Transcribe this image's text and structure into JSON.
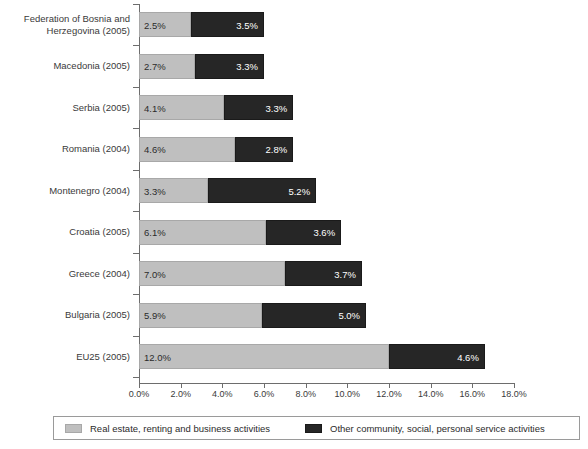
{
  "chart_data": {
    "type": "bar",
    "orientation": "horizontal",
    "stacked": true,
    "title": "",
    "xlabel": "",
    "ylabel": "",
    "xlim": [
      0,
      18
    ],
    "xtick_step": 2,
    "xticks": [
      "0.0%",
      "2.0%",
      "4.0%",
      "6.0%",
      "8.0%",
      "10.0%",
      "12.0%",
      "14.0%",
      "16.0%",
      "18.0%"
    ],
    "grid": false,
    "legend_position": "bottom",
    "categories": [
      "Federation of Bosnia and\nHerzegovina (2005)",
      "Macedonia (2005)",
      "Serbia (2005)",
      "Romania (2004)",
      "Montenegro (2004)",
      "Croatia (2005)",
      "Greece (2004)",
      "Bulgaria (2005)",
      "EU25 (2005)"
    ],
    "series": [
      {
        "name": "Real estate, renting and business activities",
        "color": "#bfbfbf",
        "values": [
          2.5,
          2.7,
          4.1,
          4.6,
          3.3,
          6.1,
          7.0,
          5.9,
          12.0
        ],
        "labels": [
          "2.5%",
          "2.7%",
          "4.1%",
          "4.6%",
          "3.3%",
          "6.1%",
          "7.0%",
          "5.9%",
          "12.0%"
        ]
      },
      {
        "name": "Other community, social, personal service activities",
        "color": "#262626",
        "values": [
          3.5,
          3.3,
          3.3,
          2.8,
          5.2,
          3.6,
          3.7,
          5.0,
          4.6
        ],
        "labels": [
          "3.5%",
          "3.3%",
          "3.3%",
          "2.8%",
          "5.2%",
          "3.6%",
          "3.7%",
          "5.0%",
          "4.6%"
        ]
      }
    ]
  },
  "legend": {
    "items": [
      {
        "label": "Real estate, renting and business activities"
      },
      {
        "label": "Other community, social, personal service activities"
      }
    ]
  }
}
